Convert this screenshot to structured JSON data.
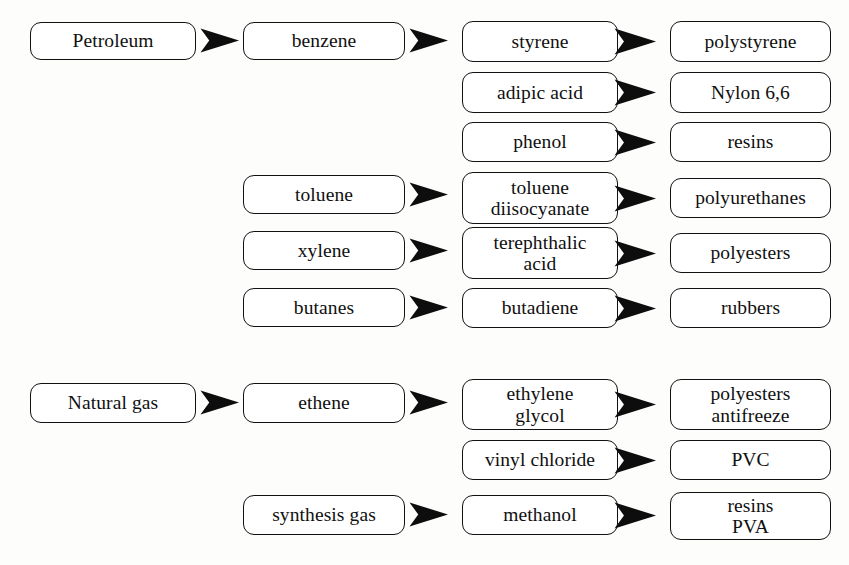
{
  "diagram": {
    "background_color": "#fdfdfc",
    "box_border_color": "#111111",
    "box_fill_color": "#ffffff",
    "arrow_color": "#0d0d0d",
    "arrow_icon": "solid-right-chevron-arrowhead",
    "nodes": [
      {
        "id": "petroleum",
        "lines": [
          "Petroleum"
        ],
        "column": 1,
        "x": 30,
        "y": 22,
        "w": 166,
        "h": 38
      },
      {
        "id": "benzene",
        "lines": [
          "benzene"
        ],
        "column": 2,
        "x": 243,
        "y": 22,
        "w": 162,
        "h": 38
      },
      {
        "id": "styrene",
        "lines": [
          "styrene"
        ],
        "column": 3,
        "x": 462,
        "y": 21,
        "w": 156,
        "h": 41
      },
      {
        "id": "polystyrene",
        "lines": [
          "polystyrene"
        ],
        "column": 4,
        "x": 670,
        "y": 21,
        "w": 161,
        "h": 41
      },
      {
        "id": "adipic-acid",
        "lines": [
          "adipic acid"
        ],
        "column": 3,
        "x": 462,
        "y": 72,
        "w": 156,
        "h": 41
      },
      {
        "id": "nylon-66",
        "lines": [
          "Nylon 6,6"
        ],
        "column": 4,
        "x": 670,
        "y": 72,
        "w": 161,
        "h": 41
      },
      {
        "id": "phenol",
        "lines": [
          "phenol"
        ],
        "column": 3,
        "x": 462,
        "y": 122,
        "w": 156,
        "h": 40
      },
      {
        "id": "resins",
        "lines": [
          "resins"
        ],
        "column": 4,
        "x": 670,
        "y": 122,
        "w": 161,
        "h": 40
      },
      {
        "id": "toluene",
        "lines": [
          "toluene"
        ],
        "column": 2,
        "x": 243,
        "y": 175,
        "w": 162,
        "h": 39
      },
      {
        "id": "toluene-diisocyanate",
        "lines": [
          "toluene",
          "diisocyanate"
        ],
        "column": 3,
        "x": 462,
        "y": 172,
        "w": 156,
        "h": 52
      },
      {
        "id": "polyurethanes",
        "lines": [
          "polyurethanes"
        ],
        "column": 4,
        "x": 670,
        "y": 178,
        "w": 161,
        "h": 40
      },
      {
        "id": "xylene",
        "lines": [
          "xylene"
        ],
        "column": 2,
        "x": 243,
        "y": 231,
        "w": 162,
        "h": 39
      },
      {
        "id": "terephthalic-acid",
        "lines": [
          "terephthalic",
          "acid"
        ],
        "column": 3,
        "x": 462,
        "y": 227,
        "w": 156,
        "h": 52
      },
      {
        "id": "polyesters-top",
        "lines": [
          "polyesters"
        ],
        "column": 4,
        "x": 670,
        "y": 233,
        "w": 161,
        "h": 40
      },
      {
        "id": "butanes",
        "lines": [
          "butanes"
        ],
        "column": 2,
        "x": 243,
        "y": 288,
        "w": 162,
        "h": 39
      },
      {
        "id": "butadiene",
        "lines": [
          "butadiene"
        ],
        "column": 3,
        "x": 462,
        "y": 288,
        "w": 156,
        "h": 40
      },
      {
        "id": "rubbers",
        "lines": [
          "rubbers"
        ],
        "column": 4,
        "x": 670,
        "y": 288,
        "w": 161,
        "h": 40
      },
      {
        "id": "natural-gas",
        "lines": [
          "Natural gas"
        ],
        "column": 1,
        "x": 30,
        "y": 383,
        "w": 166,
        "h": 40
      },
      {
        "id": "ethene",
        "lines": [
          "ethene"
        ],
        "column": 2,
        "x": 243,
        "y": 383,
        "w": 162,
        "h": 40
      },
      {
        "id": "ethylene-glycol",
        "lines": [
          "ethylene",
          "glycol"
        ],
        "column": 3,
        "x": 462,
        "y": 379,
        "w": 156,
        "h": 51
      },
      {
        "id": "polyesters-antifreeze",
        "lines": [
          "polyesters",
          "antifreeze"
        ],
        "column": 4,
        "x": 670,
        "y": 379,
        "w": 161,
        "h": 51
      },
      {
        "id": "vinyl-chloride",
        "lines": [
          "vinyl chloride"
        ],
        "column": 3,
        "x": 462,
        "y": 440,
        "w": 156,
        "h": 40
      },
      {
        "id": "pvc",
        "lines": [
          "PVC"
        ],
        "column": 4,
        "x": 670,
        "y": 440,
        "w": 161,
        "h": 40
      },
      {
        "id": "synthesis-gas",
        "lines": [
          "synthesis gas"
        ],
        "column": 2,
        "x": 243,
        "y": 495,
        "w": 162,
        "h": 40
      },
      {
        "id": "methanol",
        "lines": [
          "methanol"
        ],
        "column": 3,
        "x": 462,
        "y": 495,
        "w": 156,
        "h": 40
      },
      {
        "id": "resins-pva",
        "lines": [
          "resins",
          "PVA"
        ],
        "column": 4,
        "x": 670,
        "y": 492,
        "w": 161,
        "h": 48
      }
    ],
    "arrows": [
      {
        "id": "petroleum-to-benzene",
        "from": "petroleum",
        "to": "benzene",
        "x": 200,
        "y": 28,
        "w": 39,
        "h": 25
      },
      {
        "id": "benzene-to-styrene",
        "from": "benzene",
        "to": "styrene",
        "x": 409,
        "y": 28,
        "w": 39,
        "h": 25
      },
      {
        "id": "styrene-to-polystyrene",
        "from": "styrene",
        "to": "polystyrene",
        "x": 614,
        "y": 28,
        "w": 42,
        "h": 27
      },
      {
        "id": "adipic-acid-to-nylon-66",
        "from": "adipic-acid",
        "to": "nylon-66",
        "x": 614,
        "y": 79,
        "w": 42,
        "h": 27
      },
      {
        "id": "phenol-to-resins",
        "from": "phenol",
        "to": "resins",
        "x": 614,
        "y": 129,
        "w": 42,
        "h": 27
      },
      {
        "id": "toluene-to-toluene-diisocyanate",
        "from": "toluene",
        "to": "toluene-diisocyanate",
        "x": 409,
        "y": 182,
        "w": 39,
        "h": 25
      },
      {
        "id": "tdi-to-polyurethanes",
        "from": "toluene-diisocyanate",
        "to": "polyurethanes",
        "x": 614,
        "y": 185,
        "w": 42,
        "h": 27
      },
      {
        "id": "xylene-to-terephthalic-acid",
        "from": "xylene",
        "to": "terephthalic-acid",
        "x": 409,
        "y": 238,
        "w": 39,
        "h": 25
      },
      {
        "id": "terephthalic-to-polyesters",
        "from": "terephthalic-acid",
        "to": "polyesters-top",
        "x": 614,
        "y": 240,
        "w": 42,
        "h": 27
      },
      {
        "id": "butanes-to-butadiene",
        "from": "butanes",
        "to": "butadiene",
        "x": 409,
        "y": 295,
        "w": 39,
        "h": 25
      },
      {
        "id": "butadiene-to-rubbers",
        "from": "butadiene",
        "to": "rubbers",
        "x": 614,
        "y": 295,
        "w": 42,
        "h": 27
      },
      {
        "id": "natural-gas-to-ethene",
        "from": "natural-gas",
        "to": "ethene",
        "x": 200,
        "y": 390,
        "w": 39,
        "h": 25
      },
      {
        "id": "ethene-to-ethylene-glycol",
        "from": "ethene",
        "to": "ethylene-glycol",
        "x": 409,
        "y": 390,
        "w": 39,
        "h": 25
      },
      {
        "id": "glycol-to-polyesters-antifreeze",
        "from": "ethylene-glycol",
        "to": "polyesters-antifreeze",
        "x": 614,
        "y": 391,
        "w": 42,
        "h": 27
      },
      {
        "id": "vinyl-chloride-to-pvc",
        "from": "vinyl-chloride",
        "to": "pvc",
        "x": 614,
        "y": 447,
        "w": 42,
        "h": 27
      },
      {
        "id": "synthesis-gas-to-methanol",
        "from": "synthesis-gas",
        "to": "methanol",
        "x": 409,
        "y": 502,
        "w": 39,
        "h": 25
      },
      {
        "id": "methanol-to-resins-pva",
        "from": "methanol",
        "to": "resins-pva",
        "x": 614,
        "y": 502,
        "w": 42,
        "h": 27
      }
    ]
  }
}
